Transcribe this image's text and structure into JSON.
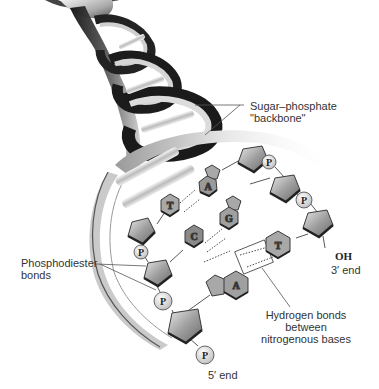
{
  "diagram": {
    "labels": {
      "backbone_line1": "Sugar–phosphate",
      "backbone_line2": "\"backbone\"",
      "phosphodiester_line1": "Phosphodiester",
      "phosphodiester_line2": "bonds",
      "hydrogen_line1": "Hydrogen bonds",
      "hydrogen_line2": "between",
      "hydrogen_line3": "nitrogenous bases",
      "oh": "OH",
      "three_prime": "3′ end",
      "five_prime": "5′ end"
    },
    "bases": {
      "left_strand": [
        "T",
        "C",
        "A"
      ],
      "right_strand": [
        "A",
        "G",
        "T"
      ]
    },
    "base_pairs": [
      {
        "left": "T",
        "right": "A"
      },
      {
        "left": "C",
        "right": "G"
      },
      {
        "left": "A",
        "right": "T"
      }
    ],
    "phosphate_label": "P",
    "phosphates": [
      "P",
      "P",
      "P",
      "P",
      "P"
    ],
    "colors": {
      "background": "#ffffff",
      "sugar_fill": "#8a8a8a",
      "sugar_edge": "#3a3a3a",
      "base_fill": "#9a9a9a",
      "phosphate_fill": "#e6e6e6",
      "helix_dark": "#1a1a1a",
      "helix_light": "#d8d8d8",
      "text": "#333333"
    }
  }
}
